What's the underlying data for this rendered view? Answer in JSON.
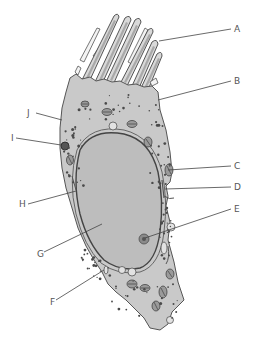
{
  "figure": {
    "labels": [
      {
        "id": "A",
        "text": "A",
        "target": "stereocilium"
      },
      {
        "id": "B",
        "text": "B",
        "target": "apical cell membrane"
      },
      {
        "id": "C",
        "text": "C",
        "target": "mitochondrion"
      },
      {
        "id": "D",
        "text": "D",
        "target": "endoplasmic reticulum"
      },
      {
        "id": "E",
        "text": "E",
        "target": "nucleolus"
      },
      {
        "id": "F",
        "text": "F",
        "target": "plasma membrane"
      },
      {
        "id": "G",
        "text": "G",
        "target": "nucleus"
      },
      {
        "id": "H",
        "text": "H",
        "target": "nuclear envelope"
      },
      {
        "id": "I",
        "text": "I",
        "target": "lysosome"
      },
      {
        "id": "J",
        "text": "J",
        "target": "cytoplasm granules"
      }
    ]
  },
  "colors": {
    "cytoplasm": "#c9c9c9",
    "nucleus": "#bdbdbd",
    "outline": "#444444",
    "label_text": "#555555",
    "background": "#ffffff"
  }
}
